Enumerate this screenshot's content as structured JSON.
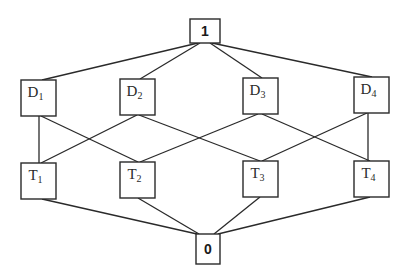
{
  "diagram": {
    "type": "lattice",
    "top": {
      "id": "top",
      "label": "1"
    },
    "bottom": {
      "id": "bottom",
      "label": "0"
    },
    "upper_row": [
      {
        "id": "D1",
        "base": "D",
        "sub": "1"
      },
      {
        "id": "D2",
        "base": "D",
        "sub": "2"
      },
      {
        "id": "D3",
        "base": "D",
        "sub": "3"
      },
      {
        "id": "D4",
        "base": "D",
        "sub": "4"
      }
    ],
    "lower_row": [
      {
        "id": "T1",
        "base": "T",
        "sub": "1"
      },
      {
        "id": "T2",
        "base": "T",
        "sub": "2"
      },
      {
        "id": "T3",
        "base": "T",
        "sub": "3"
      },
      {
        "id": "T4",
        "base": "T",
        "sub": "4"
      }
    ],
    "edges": [
      [
        "top",
        "D1"
      ],
      [
        "top",
        "D2"
      ],
      [
        "top",
        "D3"
      ],
      [
        "top",
        "D4"
      ],
      [
        "D1",
        "T1"
      ],
      [
        "D1",
        "T2"
      ],
      [
        "D2",
        "T1"
      ],
      [
        "D2",
        "T3"
      ],
      [
        "D3",
        "T2"
      ],
      [
        "D3",
        "T4"
      ],
      [
        "D4",
        "T3"
      ],
      [
        "D4",
        "T4"
      ],
      [
        "T1",
        "bottom"
      ],
      [
        "T2",
        "bottom"
      ],
      [
        "T3",
        "bottom"
      ],
      [
        "T4",
        "bottom"
      ]
    ]
  }
}
